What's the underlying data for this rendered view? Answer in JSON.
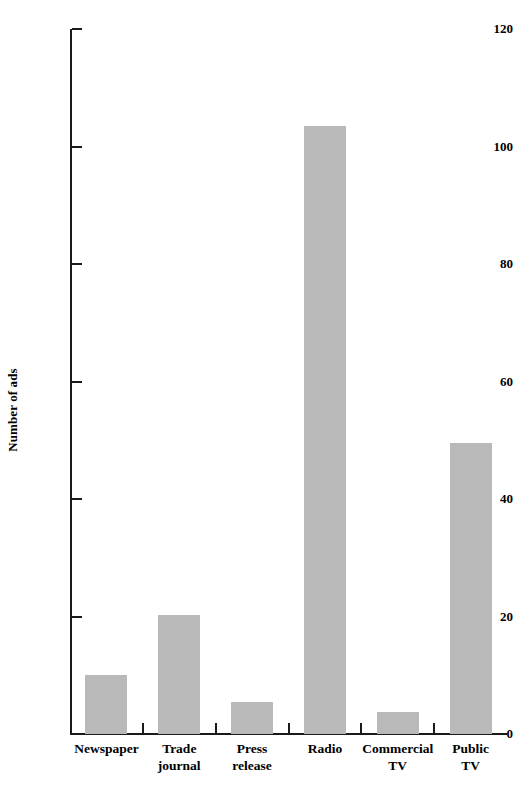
{
  "chart_data": {
    "type": "bar",
    "title": "",
    "xlabel": "",
    "ylabel": "Number of ads",
    "categories": [
      "Newspaper",
      "Trade journal",
      "Press release",
      "Radio",
      "Commercial TV",
      "Public TV"
    ],
    "category_labels_wrapped": [
      "Newspaper",
      "Trade\njournal",
      "Press\nrelease",
      "Radio",
      "Commercial\nTV",
      "Public\nTV"
    ],
    "values": [
      10,
      20.3,
      5.5,
      103.5,
      3.8,
      49.5
    ],
    "ylim": [
      0,
      120
    ],
    "ytick_values": [
      0,
      20,
      40,
      60,
      80,
      100,
      120
    ],
    "ytick_labels": [
      "0",
      "20",
      "40",
      "60",
      "80",
      "100",
      "120"
    ],
    "grid": false,
    "legend": null,
    "bar_color": "#b9b9b9",
    "axis_color": "#1a1a1a",
    "background_color": "#ffffff"
  }
}
